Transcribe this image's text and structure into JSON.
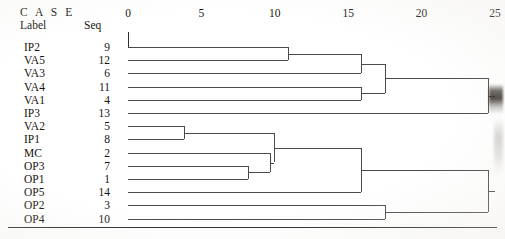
{
  "header": {
    "case_title": "C A S E",
    "label_column": "Label",
    "seq_column": "Seq"
  },
  "axis": {
    "ticks": [
      {
        "value": 0,
        "text": "0"
      },
      {
        "value": 5,
        "text": "5"
      },
      {
        "value": 10,
        "text": "10"
      },
      {
        "value": 15,
        "text": "15"
      },
      {
        "value": 20,
        "text": "20"
      },
      {
        "value": 25,
        "text": "25"
      }
    ],
    "min": 0,
    "max": 25,
    "x_origin_px": 128,
    "px_per_unit": 14.68
  },
  "leaves": [
    {
      "label": "IP2",
      "seq": "9"
    },
    {
      "label": "VA5",
      "seq": "12"
    },
    {
      "label": "VA3",
      "seq": "6"
    },
    {
      "label": "VA4",
      "seq": "11"
    },
    {
      "label": "VA1",
      "seq": "4"
    },
    {
      "label": "IP3",
      "seq": "13"
    },
    {
      "label": "VA2",
      "seq": "5"
    },
    {
      "label": "IP1",
      "seq": "8"
    },
    {
      "label": "MC",
      "seq": "2"
    },
    {
      "label": "OP3",
      "seq": "7"
    },
    {
      "label": "OP1",
      "seq": "1"
    },
    {
      "label": "OP5",
      "seq": "14"
    },
    {
      "label": "OP2",
      "seq": "3"
    },
    {
      "label": "OP4",
      "seq": "10"
    }
  ],
  "chart_data": {
    "type": "dendrogram",
    "title": "",
    "xlabel": "Rescaled Distance Cluster Combine",
    "ylabel": "",
    "xlim": [
      0,
      25
    ],
    "grid": false,
    "legend": "none",
    "leaf_order": [
      "IP2",
      "VA5",
      "VA3",
      "VA4",
      "VA1",
      "IP3",
      "VA2",
      "IP1",
      "MC",
      "OP3",
      "OP1",
      "OP5",
      "OP2",
      "OP4"
    ],
    "leaf_seq": [
      9,
      12,
      6,
      11,
      4,
      13,
      5,
      8,
      2,
      7,
      1,
      14,
      3,
      10
    ],
    "merges": [
      {
        "id": "m1",
        "members": [
          "VA2",
          "IP1"
        ],
        "distance": 3.8
      },
      {
        "id": "m2",
        "members": [
          "OP3",
          "OP1"
        ],
        "distance": 8.2
      },
      {
        "id": "m3",
        "members": [
          "MC",
          "OP3",
          "OP1"
        ],
        "distance": 9.7
      },
      {
        "id": "m4",
        "members": [
          "IP2",
          "VA5"
        ],
        "distance": 10.9
      },
      {
        "id": "m5",
        "members": [
          "VA2",
          "IP1",
          "MC",
          "OP3",
          "OP1"
        ],
        "distance": 9.95
      },
      {
        "id": "m6",
        "members": [
          "IP2",
          "VA5",
          "VA3"
        ],
        "distance": 15.9
      },
      {
        "id": "m7",
        "members": [
          "VA4",
          "VA1"
        ],
        "distance": 15.9
      },
      {
        "id": "m8",
        "members": [
          "VA2",
          "IP1",
          "MC",
          "OP3",
          "OP1",
          "OP5"
        ],
        "distance": 15.9
      },
      {
        "id": "m9",
        "members": [
          "IP2",
          "VA5",
          "VA3",
          "VA4",
          "VA1"
        ],
        "distance": 17.5
      },
      {
        "id": "m10",
        "members": [
          "OP2",
          "OP4"
        ],
        "distance": 17.5
      },
      {
        "id": "m11",
        "members": [
          "IP2",
          "VA5",
          "VA3",
          "VA4",
          "VA1",
          "IP3"
        ],
        "distance": 24.5
      },
      {
        "id": "m12",
        "members": [
          "VA2",
          "IP1",
          "MC",
          "OP3",
          "OP1",
          "OP5",
          "OP2",
          "OP4"
        ],
        "distance": 24.5
      }
    ]
  },
  "render": {
    "leaf_y_start": 47,
    "leaf_y_step": 13.2,
    "stroke": "#4a4a4a",
    "text_color": "#17150f"
  }
}
